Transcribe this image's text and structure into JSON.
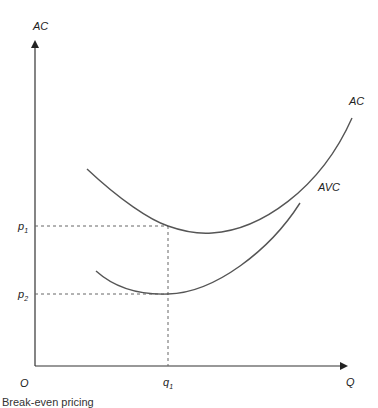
{
  "diagram": {
    "type": "cost-curves",
    "y_axis_label": "AC",
    "x_axis_label": "Q",
    "origin_label": "O",
    "price_levels": [
      {
        "label": "p",
        "subscript": "1"
      },
      {
        "label": "p",
        "subscript": "2"
      }
    ],
    "quantity_levels": [
      {
        "label": "q",
        "subscript": "1"
      }
    ],
    "curves": [
      {
        "name": "AC",
        "label": "AC"
      },
      {
        "name": "AVC",
        "label": "AVC"
      }
    ],
    "colors": {
      "axis": "#333333",
      "curve": "#555555",
      "guide": "#666666"
    }
  },
  "caption": "Break-even pricing"
}
